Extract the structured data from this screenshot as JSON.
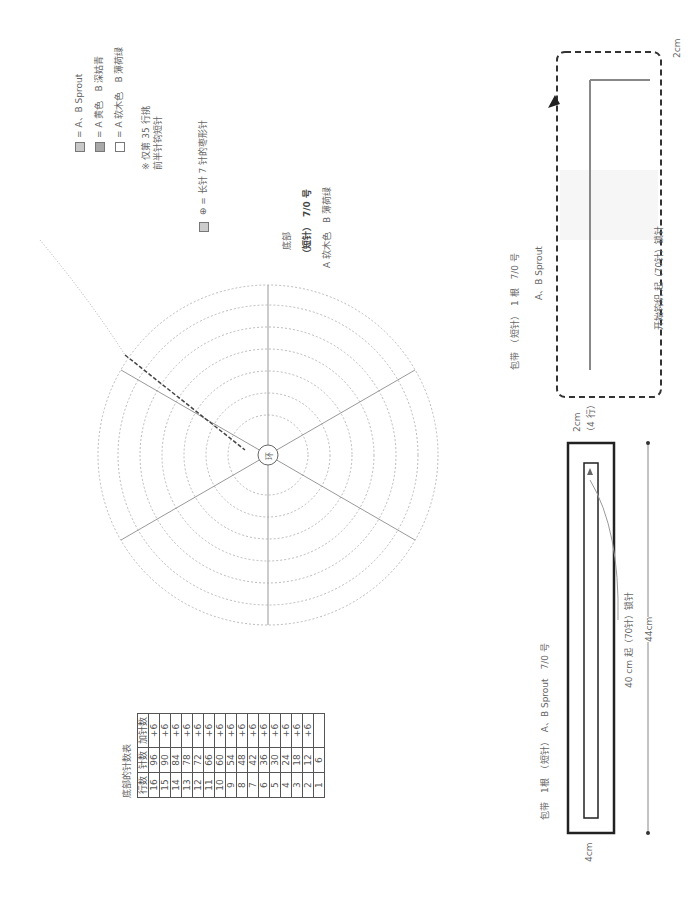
{
  "legend": {
    "items": [
      {
        "swatch": "#c8c8c8",
        "label": "= A、B Sprout"
      },
      {
        "swatch": "#a8a8a8",
        "label": "= A 黄色　B 深姑青"
      },
      {
        "swatch": "#ffffff",
        "label": "= A 软木色　B 薄荷绿"
      }
    ],
    "note_line1": "※ 仅第 35 行挑",
    "note_line2": "前半针钩短针",
    "bobble_label": "= 长针 7 针的枣形针"
  },
  "bottom_section": {
    "title": "底部",
    "hook": "（短针）　7/0 号",
    "colors": "A 软木色　B 薄荷绿",
    "center_label": "环"
  },
  "count_table": {
    "title": "底部的针数表",
    "headers": [
      "行数",
      "针数",
      "加针数"
    ],
    "rows": [
      [
        "16",
        "96",
        "+6"
      ],
      [
        "15",
        "90",
        "+6"
      ],
      [
        "14",
        "84",
        "+6"
      ],
      [
        "13",
        "78",
        "+6"
      ],
      [
        "12",
        "72",
        "+6"
      ],
      [
        "11",
        "66",
        "+6"
      ],
      [
        "10",
        "60",
        "+6"
      ],
      [
        "9",
        "54",
        "+6"
      ],
      [
        "8",
        "48",
        "+6"
      ],
      [
        "7",
        "42",
        "+6"
      ],
      [
        "6",
        "36",
        "+6"
      ],
      [
        "5",
        "30",
        "+6"
      ],
      [
        "4",
        "24",
        "+6"
      ],
      [
        "3",
        "18",
        "+6"
      ],
      [
        "2",
        "12",
        "+6"
      ],
      [
        "1",
        "6",
        ""
      ]
    ]
  },
  "strap_chart": {
    "title": "包带　（短针）　1 根　7/0 号",
    "yarn": "A、B Sprout",
    "start_note": "开始钩织 起（70针）锁针",
    "width_label": "2cm"
  },
  "strap_schematic": {
    "title": "包带　1根　（短针）　A、B Sprout　7/0 号",
    "chain_label": "40 cm 起（70针）锁针",
    "length_label": "44cm",
    "width_label": "4cm",
    "height_label": "2cm",
    "rows_label": "（4 行）"
  }
}
